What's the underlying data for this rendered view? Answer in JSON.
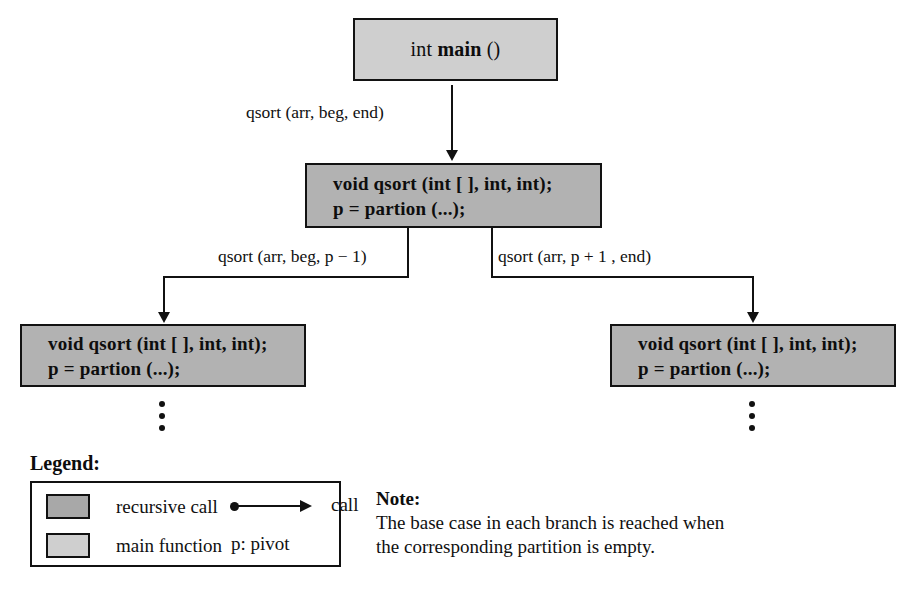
{
  "diagram": {
    "nodes": {
      "main": {
        "label_prefix": "int ",
        "label_bold": "main",
        "label_suffix": " ()",
        "full_label": "int main ()",
        "fill": "#cfcfcf",
        "kind": "main function"
      },
      "qsort_root": {
        "line1": "void qsort (int [ ], int, int);",
        "line2": "p = partion (...);",
        "fill": "#b2b2b2",
        "kind": "recursive call"
      },
      "qsort_left": {
        "line1": "void qsort (int [ ], int, int);",
        "line2": "p = partion (...);",
        "fill": "#b2b2b2",
        "kind": "recursive call"
      },
      "qsort_right": {
        "line1": "void qsort (int [ ], int, int);",
        "line2": "p = partion (...);",
        "fill": "#b2b2b2",
        "kind": "recursive call"
      }
    },
    "edges": {
      "main_to_root": "qsort (arr, beg, end)",
      "root_to_left": "qsort (arr, beg, p − 1)",
      "root_to_right": "qsort (arr, p + 1 , end)"
    },
    "ellipsis": {
      "left": "⋮",
      "right": "⋮",
      "dot_count": 3
    }
  },
  "legend": {
    "title": "Legend:",
    "rows": [
      {
        "swatch": "recursive-call-swatch",
        "label": "recursive call",
        "right_label": "call",
        "right_symbol": "arrow"
      },
      {
        "swatch": "main-function-swatch",
        "label": "main function",
        "right_label": "p: pivot",
        "right_symbol": "none"
      }
    ]
  },
  "note": {
    "title": "Note:",
    "line1": "The base case in each branch is reached when",
    "line2": "the corresponding partition is empty."
  },
  "colors": {
    "recursive_fill": "#a8a8a8",
    "main_fill": "#cfcfcf",
    "stroke": "#111111",
    "background": "#ffffff"
  }
}
